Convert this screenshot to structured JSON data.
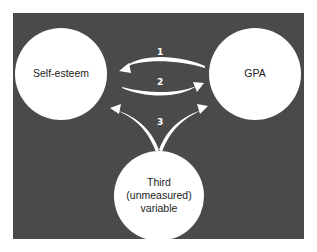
{
  "diagram": {
    "nodes": [
      {
        "id": "self-esteem",
        "label": "Self-esteem"
      },
      {
        "id": "gpa",
        "label": "GPA"
      },
      {
        "id": "third",
        "label_lines": [
          "Third",
          "(unmeasured)",
          "variable"
        ]
      }
    ],
    "arrows": [
      {
        "number": "1",
        "from": "GPA",
        "to": "Self-esteem"
      },
      {
        "number": "2",
        "from": "Self-esteem",
        "to": "GPA"
      },
      {
        "number": "3",
        "from": "Third (unmeasured) variable",
        "to": [
          "Self-esteem",
          "GPA"
        ]
      }
    ],
    "colors": {
      "background": "#4a4a4a",
      "node_fill": "#ffffff",
      "arrow": "#ffffff",
      "text": "#222222"
    }
  }
}
